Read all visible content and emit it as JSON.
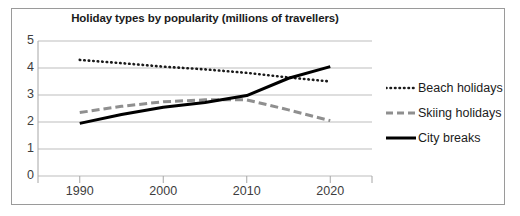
{
  "chart_data": {
    "type": "line",
    "title": "Holiday types by popularity (millions of travellers)",
    "xlabel": "",
    "ylabel": "",
    "xlim": [
      1985,
      2025
    ],
    "ylim": [
      0,
      5
    ],
    "grid": true,
    "legend_position": "right",
    "x_ticks": [
      "1990",
      "2000",
      "2010",
      "2020"
    ],
    "x_tick_values": [
      1990,
      2000,
      2010,
      2020
    ],
    "y_ticks": [
      "0",
      "1",
      "2",
      "3",
      "4",
      "5"
    ],
    "y_tick_values": [
      0,
      1,
      2,
      3,
      4,
      5
    ],
    "x": [
      1990,
      1995,
      2000,
      2005,
      2010,
      2015,
      2020
    ],
    "series": [
      {
        "name": "Beach holidays",
        "style": "dotted",
        "color": "#1b1b1b",
        "values": [
          4.3,
          4.18,
          4.05,
          3.95,
          3.82,
          3.65,
          3.5
        ]
      },
      {
        "name": "Skiing holidays",
        "style": "dashed",
        "color": "#8f8f8f",
        "values": [
          2.35,
          2.58,
          2.75,
          2.82,
          2.82,
          2.45,
          2.05
        ]
      },
      {
        "name": "City breaks",
        "style": "solid",
        "color": "#000000",
        "values": [
          1.95,
          2.28,
          2.55,
          2.72,
          2.98,
          3.62,
          4.05
        ]
      }
    ]
  },
  "legend": {
    "items": [
      {
        "label": "Beach holidays",
        "style": "dotted",
        "color": "#1b1b1b"
      },
      {
        "label": "Skiing holidays",
        "style": "dashed",
        "color": "#8f8f8f"
      },
      {
        "label": "City breaks",
        "style": "solid",
        "color": "#000000"
      }
    ]
  },
  "axes": {
    "axis_color": "#a6a6a6",
    "grid_color": "#bdbdbd",
    "tick_label_color": "#3d3d3d"
  }
}
